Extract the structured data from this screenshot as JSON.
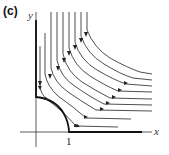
{
  "figure": {
    "panel_label": "(c)",
    "x_axis_label": "x",
    "y_axis_label": "y",
    "tick_label_x": "1"
  },
  "colors": {
    "stroke": "#222222",
    "background": "#ffffff"
  },
  "streamlines": {
    "count": 11,
    "direction": "downward then rightward",
    "boundary": "thick curve from y-axis to x=1, quarter-circle arc bounding region"
  }
}
